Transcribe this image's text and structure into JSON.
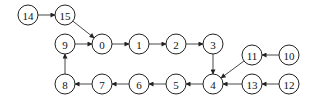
{
  "diagram": {
    "type": "directed-graph",
    "node_radius": 10,
    "colors": {
      "stroke": "#222222",
      "fill": "#ffffff",
      "edge": "#333333"
    },
    "nodes": [
      {
        "id": "0",
        "label": "0",
        "x": 102,
        "y": 44
      },
      {
        "id": "1",
        "label": "1",
        "x": 139,
        "y": 44
      },
      {
        "id": "2",
        "label": "2",
        "x": 176,
        "y": 44
      },
      {
        "id": "3",
        "label": "3",
        "x": 213,
        "y": 44
      },
      {
        "id": "4",
        "label": "4",
        "x": 213,
        "y": 84
      },
      {
        "id": "5",
        "label": "5",
        "x": 176,
        "y": 84
      },
      {
        "id": "6",
        "label": "6",
        "x": 139,
        "y": 84
      },
      {
        "id": "7",
        "label": "7",
        "x": 102,
        "y": 84
      },
      {
        "id": "8",
        "label": "8",
        "x": 65,
        "y": 84
      },
      {
        "id": "9",
        "label": "9",
        "x": 65,
        "y": 44
      },
      {
        "id": "10",
        "label": "10",
        "x": 289,
        "y": 55
      },
      {
        "id": "11",
        "label": "11",
        "x": 252,
        "y": 55
      },
      {
        "id": "12",
        "label": "12",
        "x": 289,
        "y": 84
      },
      {
        "id": "13",
        "label": "13",
        "x": 252,
        "y": 84
      },
      {
        "id": "14",
        "label": "14",
        "x": 28,
        "y": 15
      },
      {
        "id": "15",
        "label": "15",
        "x": 65,
        "y": 15
      }
    ],
    "edges": [
      {
        "from": "14",
        "to": "15"
      },
      {
        "from": "15",
        "to": "0"
      },
      {
        "from": "9",
        "to": "0"
      },
      {
        "from": "0",
        "to": "1"
      },
      {
        "from": "1",
        "to": "2"
      },
      {
        "from": "2",
        "to": "3"
      },
      {
        "from": "3",
        "to": "4"
      },
      {
        "from": "11",
        "to": "4"
      },
      {
        "from": "13",
        "to": "4"
      },
      {
        "from": "10",
        "to": "11"
      },
      {
        "from": "12",
        "to": "13"
      },
      {
        "from": "4",
        "to": "5"
      },
      {
        "from": "5",
        "to": "6"
      },
      {
        "from": "6",
        "to": "7"
      },
      {
        "from": "7",
        "to": "8"
      },
      {
        "from": "8",
        "to": "9"
      }
    ]
  }
}
